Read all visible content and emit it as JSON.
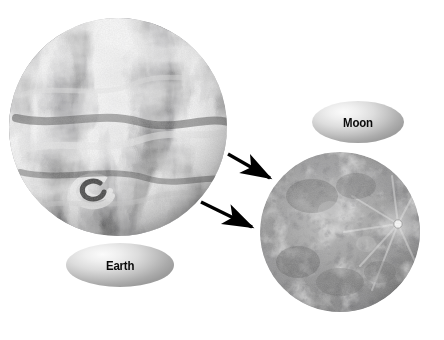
{
  "figure": {
    "background_color": "#ffffff",
    "width": 444,
    "height": 340
  },
  "bodies": [
    {
      "id": "earth",
      "name": "Earth",
      "label": "Earth",
      "image_kind": "grayscale-satellite-photo",
      "description": "Black and white satellite view of Earth showing swirling cloud bands and ocean",
      "center_x": 118,
      "center_y": 127,
      "radius": 109
    },
    {
      "id": "moon",
      "name": "Moon",
      "label": "Moon",
      "image_kind": "grayscale-lunar-photo",
      "description": "Black and white full Moon showing maria, highlands and a bright ray crater",
      "center_x": 340,
      "center_y": 232,
      "radius": 80
    }
  ],
  "labels": {
    "earth": {
      "text": "Earth",
      "shape": "ellipse",
      "text_color": "#0a0a0a",
      "fill_light": "#fbfbfb",
      "fill_dark": "#9c9c9c"
    },
    "moon": {
      "text": "Moon",
      "shape": "ellipse",
      "text_color": "#0a0a0a",
      "fill_light": "#fbfbfb",
      "fill_dark": "#9e9e9e"
    }
  },
  "arrows": [
    {
      "id": "arrow-upper",
      "from": "earth",
      "to": "moon",
      "color": "#000000",
      "x1": 228,
      "y1": 154,
      "x2": 274,
      "y2": 181
    },
    {
      "id": "arrow-lower",
      "from": "earth",
      "to": "moon",
      "color": "#000000",
      "x1": 201,
      "y1": 202,
      "x2": 257,
      "y2": 230
    }
  ],
  "features": {
    "moon_bright_crater": {
      "name": "bright ray crater",
      "x": 398,
      "y": 224
    }
  }
}
